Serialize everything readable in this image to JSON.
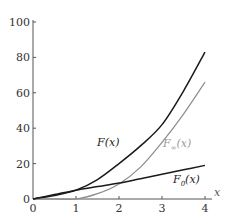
{
  "chart_data": {
    "type": "line",
    "title": "",
    "xlabel": "x",
    "ylabel": "",
    "xlim": [
      0,
      4
    ],
    "ylim": [
      0,
      100
    ],
    "grid": false,
    "legend_position": "inline labels",
    "x_ticks": [
      0,
      1,
      2,
      3,
      4
    ],
    "y_ticks": [
      0,
      20,
      40,
      60,
      80,
      100
    ],
    "x": [
      0,
      0.5,
      1,
      1.5,
      2,
      2.5,
      3,
      3.5,
      4
    ],
    "series": [
      {
        "name": "F(x)",
        "label": "F(x)",
        "color": "#1a1a1a",
        "values": [
          0,
          2,
          5,
          11,
          20,
          30,
          42,
          61,
          83
        ]
      },
      {
        "name": "F∞(x)",
        "label": "F∞(x)",
        "color": "#8c8c8c",
        "values": [
          0,
          0,
          0,
          3,
          8.5,
          18,
          32,
          48,
          66
        ]
      },
      {
        "name": "F0(x)",
        "label": "F0(x)",
        "color": "#1a1a1a",
        "values": [
          0,
          2.5,
          5,
          7,
          9,
          11.5,
          14,
          16.5,
          19
        ]
      }
    ],
    "annotations": [
      {
        "text": "F(x)",
        "x": 1.6,
        "y": 28
      },
      {
        "text": "F∞(x)",
        "x": 3.1,
        "y": 34
      },
      {
        "text": "F0(x)",
        "x": 3.2,
        "y": 12
      }
    ]
  },
  "labels": {
    "x_axis_letter": "x",
    "y_tick_labels": [
      "0",
      "20",
      "40",
      "60",
      "80",
      "100"
    ],
    "x_tick_labels": [
      "0",
      "1",
      "2",
      "3",
      "4"
    ],
    "curve_F": "F(x)",
    "curve_Finf_main": "F",
    "curve_Finf_sub": "∞",
    "curve_Finf_tail": "(x)",
    "curve_F0_main": "F",
    "curve_F0_sub": "0",
    "curve_F0_tail": "(x)"
  }
}
